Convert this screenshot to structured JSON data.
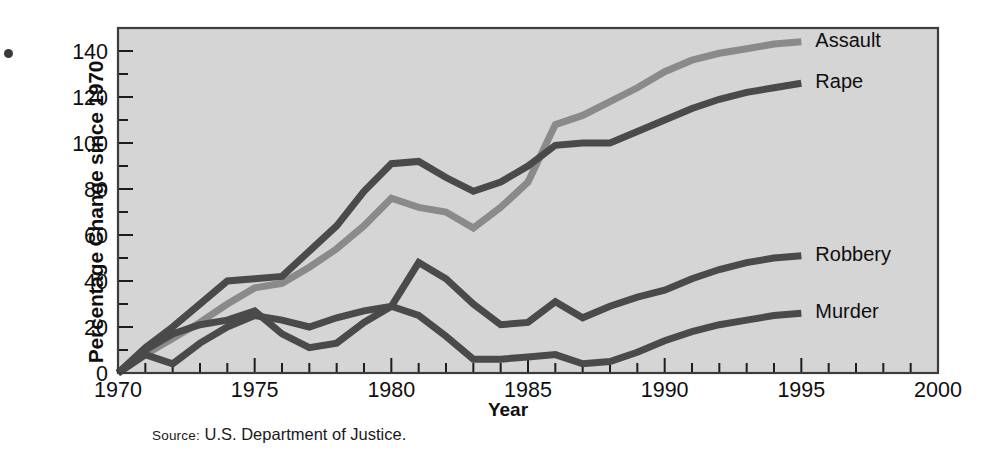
{
  "figure": {
    "margin_bullet": "•",
    "source_prefix": "Source:",
    "source_text": " U.S. Department of Justice."
  },
  "chart_data": {
    "type": "line",
    "title": "",
    "xlabel": "Year",
    "ylabel": "Percentage Change since 1970",
    "xlim": [
      1970,
      2000
    ],
    "ylim": [
      0,
      150
    ],
    "x_ticks_major": [
      1970,
      1975,
      1980,
      1985,
      1990,
      1995,
      2000
    ],
    "x_ticks_minor_step": 1,
    "y_ticks_major": [
      0,
      20,
      40,
      60,
      80,
      100,
      120,
      140
    ],
    "y_ticks_minor_step": 10,
    "grid": false,
    "legend_position": "right-inline-end-of-line",
    "colors": {
      "assault": "#8a8a8a",
      "rape": "#4a4a4a",
      "robbery": "#4a4a4a",
      "murder": "#4a4a4a",
      "plot_background": "#d5d5d5",
      "frame": "#3c3c3c",
      "text": "#0f0f0f"
    },
    "x": [
      1970,
      1971,
      1972,
      1973,
      1974,
      1975,
      1976,
      1977,
      1978,
      1979,
      1980,
      1981,
      1982,
      1983,
      1984,
      1985,
      1986,
      1987,
      1988,
      1989,
      1990,
      1991,
      1992,
      1993,
      1994,
      1995
    ],
    "series": [
      {
        "name": "Assault",
        "label": "Assault",
        "color": "#8a8a8a",
        "label_value": 144,
        "values": [
          0,
          8,
          15,
          22,
          30,
          37,
          39,
          46,
          54,
          64,
          76,
          72,
          70,
          63,
          72,
          83,
          108,
          112,
          118,
          124,
          131,
          136,
          139,
          141,
          143,
          144
        ]
      },
      {
        "name": "Rape",
        "label": "Rape",
        "color": "#4a4a4a",
        "label_value": 126,
        "values": [
          0,
          11,
          20,
          30,
          40,
          41,
          42,
          53,
          64,
          79,
          91,
          92,
          85,
          79,
          83,
          90,
          99,
          100,
          100,
          105,
          110,
          115,
          119,
          122,
          124,
          126
        ]
      },
      {
        "name": "Robbery",
        "label": "Robbery",
        "color": "#4a4a4a",
        "label_value": 51,
        "values": [
          0,
          10,
          17,
          21,
          23,
          27,
          17,
          11,
          13,
          22,
          29,
          48,
          41,
          30,
          21,
          22,
          31,
          24,
          29,
          33,
          36,
          41,
          45,
          48,
          50,
          51
        ]
      },
      {
        "name": "Murder",
        "label": "Murder",
        "color": "#4a4a4a",
        "label_value": 26,
        "values": [
          0,
          8,
          4,
          13,
          20,
          25,
          23,
          20,
          24,
          27,
          29,
          25,
          16,
          6,
          6,
          7,
          8,
          4,
          5,
          9,
          14,
          18,
          21,
          23,
          25,
          26
        ]
      }
    ]
  }
}
